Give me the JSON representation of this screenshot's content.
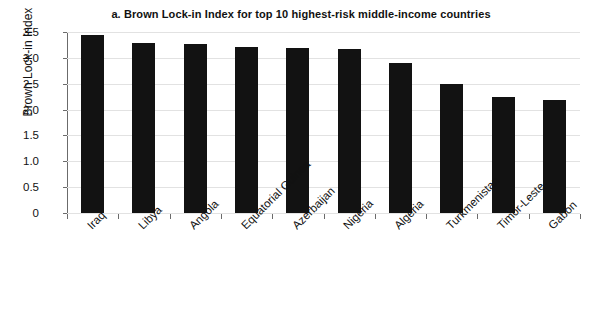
{
  "chart_data": {
    "type": "bar",
    "title": "a. Brown Lock-in Index for top 10 highest-risk middle-income countries",
    "xlabel": "",
    "ylabel": "Brown Lock-in Index",
    "categories": [
      "Iraq",
      "Libya",
      "Angola",
      "Equatorial Guinea",
      "Azerbaijan",
      "Nigeria",
      "Algeria",
      "Turkmenistan",
      "Timor-Leste",
      "Gabon"
    ],
    "values": [
      3.45,
      3.28,
      3.27,
      3.21,
      3.19,
      3.18,
      2.91,
      2.49,
      2.25,
      2.19
    ],
    "ylim": [
      0,
      3.5
    ],
    "ytick_labels": [
      "3.5",
      "3.0",
      "2.5",
      "2.0",
      "1.5",
      "1.0",
      "0.5",
      "0"
    ],
    "ytick_values": [
      3.5,
      3.0,
      2.5,
      2.0,
      1.5,
      1.0,
      0.5,
      0
    ],
    "grid": true,
    "legend": false,
    "bar_color": "#121212",
    "gridline_color": "#e2e2e2",
    "axis_color": "#6b6b6b",
    "background_color": "#ffffff",
    "xtick_label_rotation": -45
  }
}
